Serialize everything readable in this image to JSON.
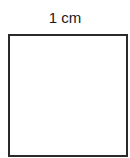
{
  "diagram": {
    "label": "1 cm",
    "shape": "square",
    "border_color": "#2a2a2a",
    "fill_color": "#ffffff"
  }
}
